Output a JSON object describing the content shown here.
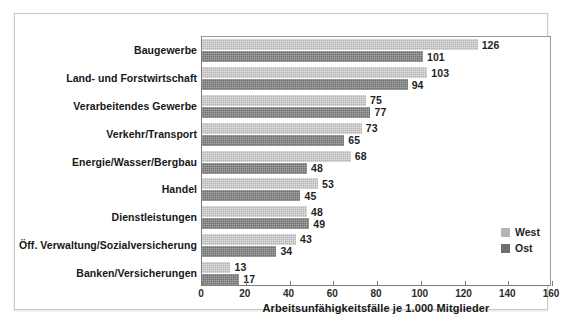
{
  "chart_data": {
    "type": "bar",
    "orientation": "horizontal",
    "title": "",
    "xlabel": "Arbeitsunfähigkeitsfälle je 1.000 Mitglieder",
    "ylabel": "",
    "xlim": [
      0,
      160
    ],
    "xticks": [
      0,
      20,
      40,
      60,
      80,
      100,
      120,
      140,
      160
    ],
    "grid": false,
    "legend_position": "bottom-right",
    "categories": [
      "Baugewerbe",
      "Land- und Forstwirtschaft",
      "Verarbeitendes Gewerbe",
      "Verkehr/Transport",
      "Energie/Wasser/Bergbau",
      "Handel",
      "Dienstleistungen",
      "Öff. Verwaltung/Sozialversicherung",
      "Banken/Versicherungen"
    ],
    "series": [
      {
        "name": "West",
        "color": "#b5b5b5",
        "values": [
          126,
          103,
          75,
          73,
          68,
          53,
          48,
          43,
          13
        ]
      },
      {
        "name": "Ost",
        "color": "#6f6f6f",
        "values": [
          101,
          94,
          77,
          65,
          48,
          45,
          49,
          34,
          17
        ]
      }
    ]
  },
  "legend": {
    "items": [
      {
        "label": "West",
        "swatch": "west"
      },
      {
        "label": "Ost",
        "swatch": "ost"
      }
    ]
  }
}
